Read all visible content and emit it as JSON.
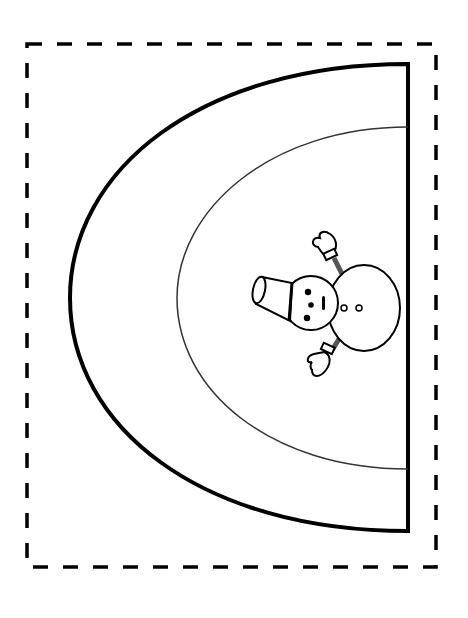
{
  "page": {
    "background": "#ffffff",
    "line_color": "#000000",
    "sleeve_color": "#8a8a8a"
  },
  "border": {
    "style": "dashed",
    "left": 27,
    "top": 44,
    "right": 436,
    "bottom": 567
  },
  "arch": {
    "outer": {
      "right_x": 408,
      "top_y": 64,
      "bottom_y": 531,
      "left_x": 70
    },
    "inner": {
      "right_x": 408,
      "top_y": 127,
      "bottom_y": 469,
      "left_x": 177
    }
  },
  "snowman": {
    "orientation": "rotated-left",
    "head": {
      "cx": 311,
      "cy": 303,
      "r": 27
    },
    "body": {
      "cx": 364,
      "cy": 308,
      "rx": 36,
      "ry": 43
    },
    "buttons_count": 2,
    "eyes_count": 2,
    "hat": "bucket",
    "mittens_count": 2
  }
}
